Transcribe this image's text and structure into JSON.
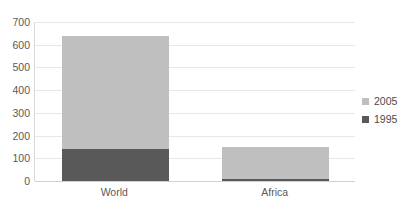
{
  "chart_data": {
    "type": "bar",
    "subtype": "stacked-bar",
    "title": "",
    "subtitle": "",
    "xlabel": "",
    "ylabel": "",
    "categories": [
      "World",
      "Africa"
    ],
    "series": [
      {
        "name": "1995",
        "color": "#595959",
        "values": [
          140,
          8
        ]
      },
      {
        "name": "2005",
        "color": "#bfbfbf",
        "values": [
          500,
          142
        ]
      }
    ],
    "totals": [
      640,
      150
    ],
    "ylim": [
      0,
      700
    ],
    "yticks": [
      0,
      100,
      200,
      300,
      400,
      500,
      600,
      700
    ],
    "ytick_labels": [
      "0",
      "100",
      "200",
      "300",
      "400",
      "500",
      "600",
      "700"
    ],
    "grid": {
      "horizontal": true,
      "vertical": false,
      "color": "#e8e8e8"
    },
    "legend": {
      "position": "right",
      "orientation": "vertical",
      "entries": [
        {
          "label": "2005",
          "color": "#bfbfbf"
        },
        {
          "label": "1995",
          "color": "#595959"
        }
      ]
    },
    "background": "#ffffff",
    "axis_line_color": "#d9d9d9",
    "tick_label_color": "#5a5a5a"
  }
}
